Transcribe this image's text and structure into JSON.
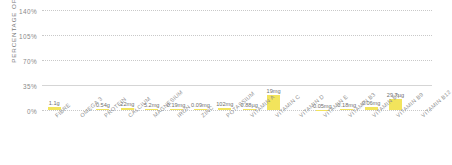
{
  "chart_data": {
    "type": "bar",
    "title": "",
    "xlabel": "",
    "ylabel": "PERCENTAGE OF RDA",
    "ylim": [
      0,
      140
    ],
    "yticks": [
      "0%",
      "35%",
      "70%",
      "105%",
      "140%"
    ],
    "ytick_values": [
      0,
      35,
      70,
      105,
      140
    ],
    "grid": true,
    "legend": "none",
    "bar_color": "#F2E45C",
    "categories": [
      "FIBRE",
      "OMEGA 3",
      "PROTEIN",
      "CALCIUM",
      "MAGNESIUM",
      "IRON",
      "ZINC",
      "POTASSIUM",
      "VITAMIN A",
      "VITAMIN C",
      "VITAMIN D",
      "VITAMIN E",
      "VITAMIN B3",
      "VITAMIN B6",
      "VITAMIN B9",
      "VITAMIN B12"
    ],
    "values": [
      4.4,
      0,
      1.1,
      2.8,
      1.5,
      1.4,
      0.9,
      2.9,
      0.9,
      21.1,
      0,
      0.3,
      1.1,
      4.3,
      14.9,
      0
    ],
    "data_labels": [
      "1.1g",
      "",
      "0.54g",
      "22mg",
      "5.2mg",
      "0.19mg",
      "0.09mg",
      "102mg",
      "0.88µg",
      "19mg",
      "",
      "0.05mg",
      "0.18mg",
      "0.06mg",
      "29.7µg",
      ""
    ]
  },
  "axis": {
    "y_title": "PERCENTAGE OF RDA"
  }
}
